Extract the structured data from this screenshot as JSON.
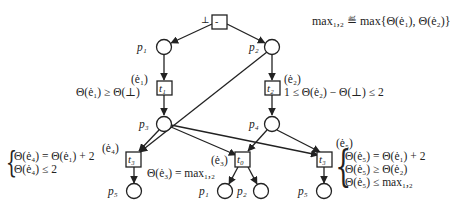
{
  "definition": "max₁,₂ ≝ max{Θ(ė₁), Θ(ė₂)}",
  "places": {
    "p1_top": "p₁",
    "p2_top": "p₂",
    "p3": "p₃",
    "p4": "p₄",
    "p5_left": "p₅",
    "p1_bottom": "p₁",
    "p2_bottom": "p₂",
    "p5_right": "p₅"
  },
  "transitions": {
    "start": "-",
    "start_label": "⊥",
    "t1": "t₁",
    "t2": "t₂",
    "t3_left": "t₃",
    "t0": "t₀",
    "t3_right": "t₃"
  },
  "events": {
    "e1": "(ė₁)",
    "e2": "(ė₂)",
    "e3": "(ė₃)",
    "e4": "(ė₄)",
    "e5": "(ė₅)"
  },
  "constraints": {
    "e1": "Θ(ė₁) ≥ Θ(⊥)",
    "e2": "1 ≤ Θ(ė₂) − Θ(⊥) ≤ 2",
    "e3": "Θ(ė₃) = max₁,₂",
    "e4": [
      "Θ(ė₄) = Θ(ė₁) + 2",
      "Θ(ė₄) ≤ 2"
    ],
    "e5": [
      "Θ(ė₅) = Θ(ė₁) + 2",
      "Θ(ė₅) ≥ Θ(ė₂)",
      "Θ(ė₅) ≤ max₁,₂"
    ]
  }
}
